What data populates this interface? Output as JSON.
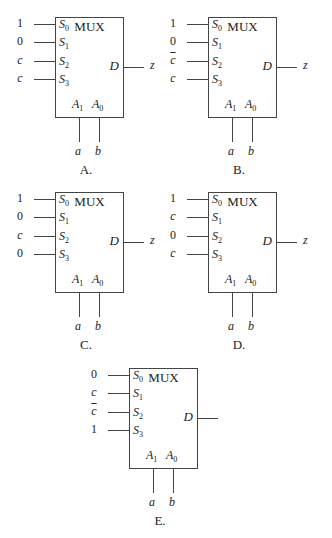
{
  "diagrams": {
    "A": {
      "caption": "A.",
      "title": "MUX",
      "inputs": [
        "1",
        "0",
        "c",
        "c"
      ],
      "inputs_bar": [
        false,
        false,
        false,
        false
      ],
      "inputs_italic": [
        false,
        false,
        true,
        true
      ],
      "output": "z",
      "addr": [
        "a",
        "b"
      ]
    },
    "B": {
      "caption": "B.",
      "title": "MUX",
      "inputs": [
        "1",
        "0",
        "c",
        "c"
      ],
      "inputs_bar": [
        false,
        false,
        true,
        false
      ],
      "inputs_italic": [
        false,
        false,
        true,
        true
      ],
      "output": "z",
      "addr": [
        "a",
        "b"
      ]
    },
    "C": {
      "caption": "C.",
      "title": "MUX",
      "inputs": [
        "1",
        "0",
        "c",
        "0"
      ],
      "inputs_bar": [
        false,
        false,
        false,
        false
      ],
      "inputs_italic": [
        false,
        false,
        true,
        false
      ],
      "output": "z",
      "addr": [
        "a",
        "b"
      ]
    },
    "D": {
      "caption": "D.",
      "title": "MUX",
      "inputs": [
        "1",
        "c",
        "0",
        "c"
      ],
      "inputs_bar": [
        false,
        false,
        false,
        false
      ],
      "inputs_italic": [
        false,
        true,
        false,
        true
      ],
      "output": "z",
      "addr": [
        "a",
        "b"
      ]
    },
    "E": {
      "caption": "E.",
      "title": "MUX",
      "inputs": [
        "0",
        "c",
        "c",
        "1"
      ],
      "inputs_bar": [
        false,
        false,
        true,
        false
      ],
      "inputs_italic": [
        false,
        true,
        true,
        false
      ],
      "output": "",
      "addr": [
        "a",
        "b"
      ]
    }
  },
  "labels": {
    "select": [
      "S",
      "S",
      "S",
      "S"
    ],
    "select_sub": [
      "0",
      "1",
      "2",
      "3"
    ],
    "data_out": "D",
    "addr": [
      "A",
      "A"
    ],
    "addr_sub": [
      "1",
      "0"
    ]
  }
}
